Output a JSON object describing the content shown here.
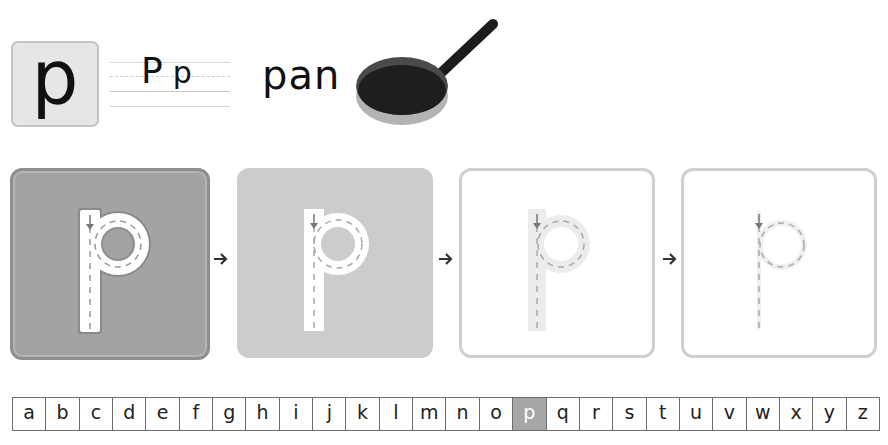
{
  "header": {
    "letter": "p",
    "letter_pair": {
      "upper": "P",
      "lower": "p"
    },
    "word": "pan",
    "picture": "frying-pan"
  },
  "tracing_steps": [
    {
      "step": 1,
      "style": "raised-outline",
      "letter": "p",
      "background": "#a3a3a3"
    },
    {
      "step": 2,
      "style": "solid-track",
      "letter": "p",
      "background": "#cccccc"
    },
    {
      "step": 3,
      "style": "faded-track",
      "letter": "p",
      "background": "#ffffff"
    },
    {
      "step": 4,
      "style": "dashed-only",
      "letter": "p",
      "background": "#ffffff"
    }
  ],
  "step_arrow": "→",
  "alphabet": {
    "letters": [
      "a",
      "b",
      "c",
      "d",
      "e",
      "f",
      "g",
      "h",
      "i",
      "j",
      "k",
      "l",
      "m",
      "n",
      "o",
      "p",
      "q",
      "r",
      "s",
      "t",
      "u",
      "v",
      "w",
      "x",
      "y",
      "z"
    ],
    "selected": "p",
    "selected_index": 15
  },
  "colors": {
    "selected_cell": "#a6a6a6",
    "card1": "#a3a3a3",
    "card2": "#cccccc",
    "border": "#cfcfcf",
    "pan_body": "#1e1e1e",
    "pan_base": "#b3b3b3"
  }
}
